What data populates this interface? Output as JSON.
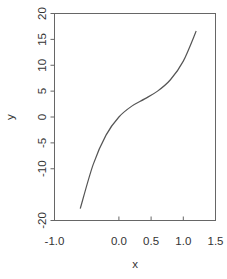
{
  "chart_data": {
    "type": "line",
    "title": "",
    "xlabel": "x",
    "ylabel": "y",
    "xlim": [
      -1.0,
      1.5
    ],
    "ylim": [
      -20,
      20
    ],
    "grid": false,
    "legend": null,
    "x_ticks": [
      "-1.0",
      "0.0",
      "0.5",
      "1.0",
      "1.5"
    ],
    "y_ticks": [
      "-20",
      "-10",
      "-5",
      "0",
      "5",
      "10",
      "15",
      "20"
    ],
    "series": [
      {
        "name": "y",
        "x": [
          -0.6,
          -0.4,
          -0.2,
          0.0,
          0.2,
          0.4,
          0.6,
          0.8,
          1.0,
          1.2
        ],
        "y": [
          -17.7,
          -9.2,
          -3.5,
          0.0,
          2.1,
          3.5,
          5.0,
          7.2,
          10.8,
          16.6
        ]
      }
    ]
  },
  "colors": {
    "line": "#555555",
    "axis": "#555555",
    "text": "#333333"
  }
}
